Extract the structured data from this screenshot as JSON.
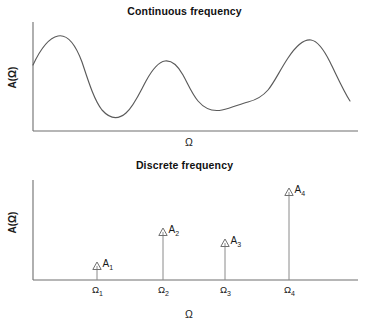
{
  "figure": {
    "panels": [
      {
        "id": "continuous",
        "title": "Continuous frequency",
        "ylabel": "A(Ω)",
        "xlabel": "Ω"
      },
      {
        "id": "discrete",
        "title": "Discrete frequency",
        "ylabel": "A(Ω)",
        "xlabel": "Ω"
      }
    ],
    "colors": {
      "background": "#ffffff",
      "axis": "#6e6e6e",
      "curve": "#5a5a5a",
      "stem": "#8a8a8a",
      "arrowhead": "#707070",
      "text": "#1a1a1a"
    }
  },
  "chart_data": [
    {
      "type": "line",
      "title": "Continuous frequency",
      "xlabel": "Ω",
      "ylabel": "A(Ω)",
      "grid": false,
      "legend": false,
      "xticklabels": [],
      "yticklabels": [],
      "xlim": [
        0,
        1
      ],
      "ylim": [
        0,
        1
      ],
      "description": "Smooth continuous spectrum A(Ω) with four lobes: a tall early peak, a medium middle peak, a low broad shoulder, and a tallest late peak, decaying at the right edge.",
      "x": [
        0.0,
        0.05,
        0.09,
        0.13,
        0.18,
        0.23,
        0.28,
        0.32,
        0.37,
        0.4,
        0.44,
        0.49,
        0.53,
        0.57,
        0.61,
        0.65,
        0.7,
        0.74,
        0.78,
        0.82,
        0.86,
        0.9,
        0.94,
        0.97,
        1.0
      ],
      "y": [
        0.58,
        0.74,
        0.84,
        0.8,
        0.63,
        0.4,
        0.23,
        0.2,
        0.33,
        0.48,
        0.62,
        0.66,
        0.6,
        0.48,
        0.38,
        0.32,
        0.33,
        0.38,
        0.4,
        0.48,
        0.7,
        0.88,
        0.92,
        0.78,
        0.42
      ]
    },
    {
      "type": "bar",
      "title": "Discrete frequency",
      "xlabel": "Ω",
      "ylabel": "A(Ω)",
      "grid": false,
      "legend": false,
      "style": "stem-plot-with-open-triangle-arrowheads",
      "categories": [
        "Ω₁",
        "Ω₂",
        "Ω₃",
        "Ω₄"
      ],
      "point_labels": [
        "A₁",
        "A₂",
        "A₃",
        "A₄"
      ],
      "values": [
        0.18,
        0.52,
        0.42,
        0.92
      ],
      "xlim": [
        0,
        1
      ],
      "ylim": [
        0,
        1
      ]
    }
  ],
  "continuous_plot": {
    "axis": {
      "x0": 33,
      "y0": 131,
      "x1": 358,
      "ytop": 22
    },
    "path": "M 33,65 C 40,50 48,38 58,36 C 68,34 76,46 82,62 C 88,80 94,100 102,110 C 110,119 118,120 126,113 C 134,106 140,92 146,81 C 152,70 158,62 165,61 C 172,60 178,66 183,75 C 188,84 192,94 198,101 C 204,108 212,112 222,110 C 232,108 240,104 248,102 C 256,100 262,97 268,90 C 274,83 280,70 288,58 C 296,46 304,39 311,40 C 318,41 324,50 330,62 C 336,74 343,90 350,101"
  },
  "discrete_plot": {
    "axis": {
      "x0": 33,
      "y0": 280,
      "x1": 358,
      "ytop": 180
    },
    "stems": [
      {
        "label": "A",
        "sub": "1",
        "tick": "Ω",
        "ticksub": "1",
        "x": 97,
        "top": 262
      },
      {
        "label": "A",
        "sub": "2",
        "tick": "Ω",
        "ticksub": "2",
        "x": 163,
        "top": 228
      },
      {
        "label": "A",
        "sub": "3",
        "tick": "Ω",
        "ticksub": "3",
        "x": 225,
        "top": 239
      },
      {
        "label": "A",
        "sub": "4",
        "tick": "Ω",
        "ticksub": "4",
        "x": 289,
        "top": 188
      }
    ]
  }
}
